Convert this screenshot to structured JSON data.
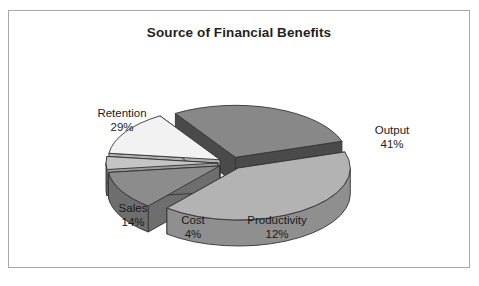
{
  "chart": {
    "title": "Source of Financial Benefits"
  },
  "chart_data": {
    "type": "pie",
    "title": "Source of Financial Benefits",
    "xlabel": "",
    "ylabel": "",
    "exploded": true,
    "three_d": true,
    "legend": "none",
    "labels_position": "outside",
    "units": "percent",
    "categories": [
      "Output",
      "Productivity",
      "Cost",
      "Sales",
      "Retention"
    ],
    "values": [
      41,
      12,
      4,
      14,
      29
    ],
    "slices": [
      {
        "name": "Output",
        "value": 41,
        "label": "Output",
        "percent_label": "41%",
        "top_color": "#b3b3b3",
        "side_color": "#8f8f8f"
      },
      {
        "name": "Productivity",
        "value": 12,
        "label": "Productivity",
        "percent_label": "12%",
        "top_color": "#8c8c8c",
        "side_color": "#6e6e6e"
      },
      {
        "name": "Cost",
        "value": 4,
        "label": "Cost",
        "percent_label": "4%",
        "top_color": "#c4c4c4",
        "side_color": "#9a9a9a"
      },
      {
        "name": "Sales",
        "value": 14,
        "label": "Sales",
        "percent_label": "14%",
        "top_color": "#f2f2f2",
        "side_color": "#b0b0b0"
      },
      {
        "name": "Retention",
        "value": 29,
        "label": "Retention",
        "percent_label": "29%",
        "top_color": "#888888",
        "side_color": "#4a4a4a"
      }
    ],
    "total": 100
  },
  "style": {
    "frame_border_color": "#a8a8a8",
    "background_color": "#ffffff",
    "text_color": "#1a1a1a",
    "outline_color": "#333333"
  }
}
